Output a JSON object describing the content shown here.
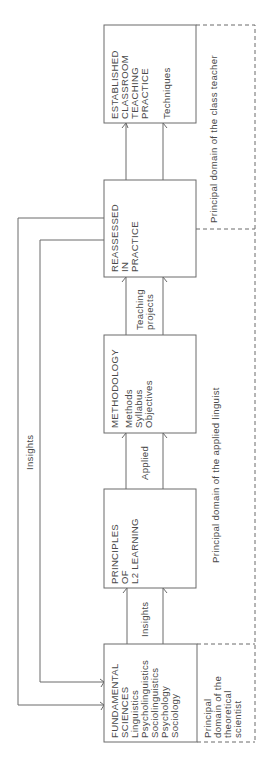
{
  "diagram": {
    "orientation": "rotated 90 degrees counter-clockwise",
    "stages": [
      {
        "id": "fundamental",
        "heading": [
          "FUNDAMENTAL",
          "SCIENCES"
        ],
        "items": [
          "Linguistics",
          "Psycholinguistics",
          "Sociolinguistics",
          "Psychology",
          "Sociology"
        ]
      },
      {
        "id": "principles",
        "heading": [
          "PRINCIPLES",
          "OF",
          "L2 LEARNING"
        ],
        "items": []
      },
      {
        "id": "methodology",
        "heading": [
          "METHODOLOGY"
        ],
        "items": [
          "Methods",
          "Syllabus",
          "Objectives"
        ]
      },
      {
        "id": "reassessed",
        "heading": [
          "REASSESSED",
          "IN",
          "PRACTICE"
        ],
        "items": []
      },
      {
        "id": "established",
        "heading": [
          "ESTABLISHED",
          "CLASSROOM",
          "TEACHING",
          "PRACTICE"
        ],
        "items": [
          "Techniques"
        ]
      }
    ],
    "connectors": [
      {
        "from": "fundamental",
        "to": "principles",
        "label": [
          "Insights"
        ]
      },
      {
        "from": "principles",
        "to": "methodology",
        "label": [
          "Applied"
        ]
      },
      {
        "from": "methodology",
        "to": "reassessed",
        "label": [
          "Teaching",
          "projects"
        ]
      },
      {
        "from": "reassessed",
        "to": "established",
        "label": []
      }
    ],
    "feedback": {
      "label": "Insights",
      "description": "Two feedback lines from REASSESSED IN PRACTICE back to FUNDAMENTAL SCIENCES"
    },
    "domains": {
      "theoretical": [
        "Principal",
        "domain of the",
        "theoretical",
        "scientist"
      ],
      "applied": "Principal domain of the applied linguist",
      "teacher": "Principal domain of the class teacher"
    }
  }
}
